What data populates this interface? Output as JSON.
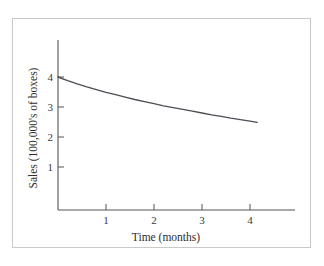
{
  "chart_data": {
    "type": "line",
    "title": "",
    "xlabel": "Time (months)",
    "ylabel": "Sales (100,000's of boxes)",
    "xlim": [
      0,
      4.95
    ],
    "ylim": [
      0,
      4.45
    ],
    "xticks": [
      1,
      2,
      3,
      4
    ],
    "yticks": [
      1,
      2,
      3,
      4
    ],
    "xtick_labels": [
      "1",
      "2",
      "3",
      "4"
    ],
    "ytick_labels": [
      "1",
      "2",
      "3",
      "4"
    ],
    "grid": false,
    "legend": null,
    "series": [
      {
        "name": "Sales decay",
        "color": "#4d4d55",
        "x": [
          0.0,
          0.2,
          0.4,
          0.6,
          0.8,
          1.0,
          1.2,
          1.4,
          1.6,
          1.8,
          2.0,
          2.2,
          2.4,
          2.6,
          2.8,
          3.0,
          3.2,
          3.4,
          3.6,
          3.8,
          4.0,
          4.15
        ],
        "y": [
          4.0,
          3.88,
          3.77,
          3.67,
          3.58,
          3.49,
          3.41,
          3.33,
          3.25,
          3.18,
          3.11,
          3.04,
          2.98,
          2.92,
          2.86,
          2.8,
          2.74,
          2.69,
          2.63,
          2.58,
          2.53,
          2.49
        ]
      }
    ],
    "annotations": []
  },
  "axes": {
    "x_axis_label": "Time (months)",
    "y_axis_label": "Sales (100,000's of boxes)",
    "x_tick_1": "1",
    "x_tick_2": "2",
    "x_tick_3": "3",
    "x_tick_4": "4",
    "y_tick_1": "1",
    "y_tick_2": "2",
    "y_tick_3": "3",
    "y_tick_4": "4"
  },
  "colors": {
    "curve": "#4d4d55",
    "axis": "#555555",
    "frame": "#c9c9c9",
    "background": "#ffffff"
  }
}
